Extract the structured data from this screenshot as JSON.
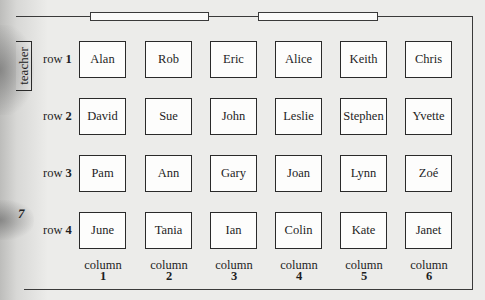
{
  "diagram": {
    "title": "",
    "teacher_label": "teacher",
    "row_prefix": "row",
    "column_prefix": "column",
    "rows": [
      {
        "label": "row",
        "number": "1",
        "students": [
          "Alan",
          "Rob",
          "Eric",
          "Alice",
          "Keith",
          "Chris"
        ]
      },
      {
        "label": "row",
        "number": "2",
        "students": [
          "David",
          "Sue",
          "John",
          "Leslie",
          "Stephen",
          "Yvette"
        ]
      },
      {
        "label": "row",
        "number": "3",
        "students": [
          "Pam",
          "Ann",
          "Gary",
          "Joan",
          "Lynn",
          "Zoé"
        ]
      },
      {
        "label": "row",
        "number": "4",
        "students": [
          "June",
          "Tania",
          "Ian",
          "Colin",
          "Kate",
          "Janet"
        ]
      }
    ],
    "columns": [
      {
        "label": "column",
        "number": "1"
      },
      {
        "label": "column",
        "number": "2"
      },
      {
        "label": "column",
        "number": "3"
      },
      {
        "label": "column",
        "number": "4"
      },
      {
        "label": "column",
        "number": "5"
      },
      {
        "label": "column",
        "number": "6"
      }
    ],
    "windows_count": 2,
    "page_mark": "7"
  }
}
